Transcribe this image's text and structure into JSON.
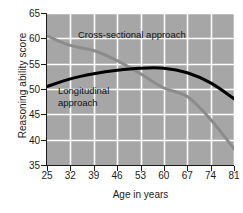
{
  "chart_data": {
    "type": "line",
    "title": "",
    "xlabel": "Age in years",
    "ylabel": "Reasoning ability score",
    "xlim": [
      25,
      81
    ],
    "ylim": [
      35,
      65
    ],
    "grid": true,
    "legend_position": "in-plot-annotations",
    "xticks": [
      25,
      32,
      39,
      46,
      53,
      60,
      67,
      74,
      81
    ],
    "yticks": [
      35,
      40,
      45,
      50,
      55,
      60,
      65
    ],
    "x": [
      25,
      32,
      39,
      46,
      53,
      60,
      67,
      74,
      81
    ],
    "series": [
      {
        "name": "Cross-sectional approach",
        "color": "#8c8c8c",
        "values": [
          60.5,
          58.6,
          57.6,
          55.6,
          53.0,
          50.2,
          48.5,
          44.0,
          38.2
        ]
      },
      {
        "name": "Longitudinal approach",
        "color": "#000000",
        "values": [
          50.5,
          52.0,
          53.0,
          53.7,
          54.1,
          54.1,
          53.2,
          51.2,
          48.1
        ]
      }
    ],
    "annotations": [
      {
        "text": "Cross-sectional approach",
        "series": "Cross-sectional approach"
      },
      {
        "text": "Longitudinal\napproach",
        "series": "Longitudinal approach"
      }
    ],
    "colors": {
      "plot_background": "#a6a6a6",
      "gridline": "#ffffff",
      "axis": "#1a1a1a",
      "page_background": "#ffffff",
      "cross_sectional_line": "#8c8c8c",
      "longitudinal_line": "#000000"
    }
  }
}
